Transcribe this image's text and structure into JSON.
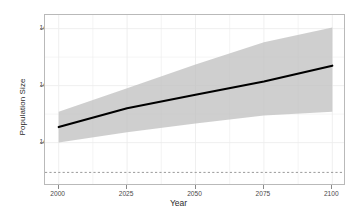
{
  "chart_data": {
    "type": "line",
    "title": "",
    "xlabel": "Year",
    "ylabel": "Population Size",
    "grid": true,
    "legend": false,
    "yscale": "log",
    "xlim": [
      1995,
      2105
    ],
    "ylim": [
      3000,
      3000000000
    ],
    "xticks": [
      2000,
      2025,
      2050,
      2075,
      2100
    ],
    "xticklabels": [
      "2000",
      "2025",
      "2050",
      "2075",
      "2100"
    ],
    "yticks": [
      100000,
      10000000,
      1000000000
    ],
    "yticklabels": [
      "1e+05",
      "1e+07",
      "1e+09"
    ],
    "series": [
      {
        "name": "median projection",
        "style": "solid-black-line",
        "color": "#000000",
        "x": [
          2000,
          2025,
          2050,
          2075,
          2100
        ],
        "values": [
          350000,
          1600000,
          4800000,
          14000000,
          50000000
        ]
      }
    ],
    "ribbon": {
      "name": "projection interval",
      "color": "#bfbfbf",
      "opacity": 0.75,
      "x": [
        2000,
        2025,
        2050,
        2075,
        2100
      ],
      "lower": [
        100000,
        230000,
        470000,
        900000,
        1200000
      ],
      "upper": [
        1200000,
        8000000,
        55000000,
        330000000,
        1100000000
      ]
    },
    "reference_line": {
      "name": "extinction threshold",
      "style": "dashed",
      "color": "#9a9a9a",
      "orientation": "horizontal",
      "value": 9000
    }
  },
  "axes": {
    "y_title": "Population Size",
    "x_title": "Year"
  }
}
